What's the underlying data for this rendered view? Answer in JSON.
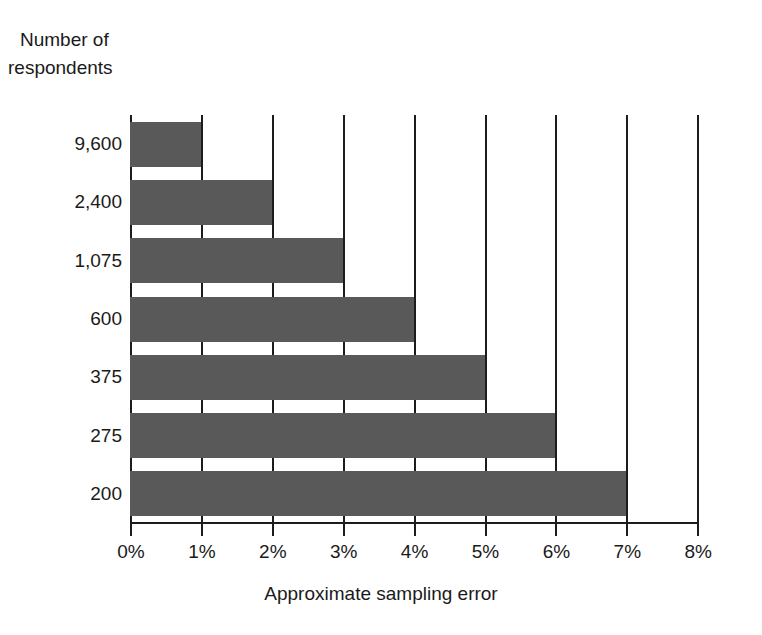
{
  "chart_data": {
    "type": "bar",
    "orientation": "horizontal",
    "title": "",
    "ylabel_line1": "Number of",
    "ylabel_line2": "respondents",
    "xlabel": "Approximate sampling error",
    "categories": [
      "9,600",
      "2,400",
      "1,075",
      "600",
      "375",
      "275",
      "200"
    ],
    "values": [
      1,
      2,
      3,
      4,
      5,
      6,
      7
    ],
    "value_suffix": "%",
    "xlim": [
      0,
      8
    ],
    "xticks": [
      0,
      1,
      2,
      3,
      4,
      5,
      6,
      7,
      8
    ],
    "xtick_labels": [
      "0%",
      "1%",
      "2%",
      "3%",
      "4%",
      "5%",
      "6%",
      "7%",
      "8%"
    ],
    "grid": "vertical",
    "legend": "none",
    "bar_color": "#595959",
    "axis_color": "#1c1c1c",
    "background": "#ffffff"
  }
}
